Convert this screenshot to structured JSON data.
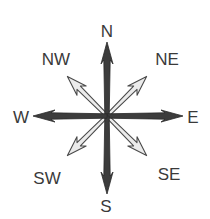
{
  "compass": {
    "center": [
      107,
      116
    ],
    "colors": {
      "cardinal_fill": "#3c3c3c",
      "cardinal_stroke": "#2a2a2a",
      "intercardinal_fill": "#ebebeb",
      "intercardinal_stroke": "#4a4a4a",
      "label": "#3a3a3a"
    },
    "directions": [
      {
        "key": "N",
        "label": "N",
        "type": "cardinal",
        "angle": 0,
        "length": 74,
        "label_pos": [
          107,
          31
        ]
      },
      {
        "key": "NE",
        "label": "NE",
        "type": "intercardinal",
        "angle": 45,
        "length": 56,
        "label_pos": [
          167,
          59
        ]
      },
      {
        "key": "E",
        "label": "E",
        "type": "cardinal",
        "angle": 90,
        "length": 76,
        "label_pos": [
          193,
          117
        ]
      },
      {
        "key": "SE",
        "label": "SE",
        "type": "intercardinal",
        "angle": 135,
        "length": 56,
        "label_pos": [
          169,
          174
        ]
      },
      {
        "key": "S",
        "label": "S",
        "type": "cardinal",
        "angle": 180,
        "length": 78,
        "label_pos": [
          106,
          206
        ]
      },
      {
        "key": "SW",
        "label": "SW",
        "type": "intercardinal",
        "angle": 225,
        "length": 56,
        "label_pos": [
          47,
          178
        ]
      },
      {
        "key": "W",
        "label": "W",
        "type": "cardinal",
        "angle": 270,
        "length": 74,
        "label_pos": [
          21,
          117
        ]
      },
      {
        "key": "NW",
        "label": "NW",
        "type": "intercardinal",
        "angle": 315,
        "length": 56,
        "label_pos": [
          56,
          59
        ]
      }
    ]
  }
}
